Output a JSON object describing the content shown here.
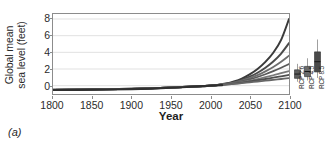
{
  "panel": {
    "letter": "(a)"
  },
  "chart_data": {
    "type": "line",
    "title": "",
    "xlabel": "Year",
    "ylabel": "Global mean sea level (feet)",
    "ylabel_line1": "Global mean",
    "ylabel_line2": "sea level (feet)",
    "xlim": [
      1800,
      2100
    ],
    "ylim": [
      -1.0,
      8.6
    ],
    "xticks": [
      1800,
      1850,
      1900,
      1950,
      2000,
      2050,
      2100
    ],
    "xticklabels": [
      "1800",
      "1850",
      "1900",
      "1950",
      "2000",
      "2050",
      "2100"
    ],
    "yticks": [
      0,
      2,
      4,
      6,
      8
    ],
    "yticklabels": [
      "0",
      "2",
      "4",
      "6",
      "8"
    ],
    "grid": true,
    "grid_axis": "y",
    "legend": "none",
    "colors": {
      "axis": "#8c8c8c",
      "grid": "#d9d9d9",
      "text": "#2b2b2b",
      "background": "#ffffff"
    },
    "series": [
      {
        "name": "Extreme",
        "color": "#3a3a3a",
        "width": 2.0,
        "x": [
          1800,
          1850,
          1900,
          1950,
          1980,
          2000,
          2010,
          2020,
          2030,
          2040,
          2050,
          2060,
          2070,
          2080,
          2090,
          2100
        ],
        "values": [
          -0.5,
          -0.45,
          -0.38,
          -0.22,
          -0.1,
          0.0,
          0.1,
          0.25,
          0.5,
          0.85,
          1.35,
          2.0,
          2.85,
          3.95,
          5.5,
          8.0
        ]
      },
      {
        "name": "High",
        "color": "#4a4a4a",
        "width": 2.0,
        "x": [
          1800,
          1850,
          1900,
          1950,
          1980,
          2000,
          2010,
          2020,
          2030,
          2040,
          2050,
          2060,
          2070,
          2080,
          2090,
          2100
        ],
        "values": [
          -0.5,
          -0.45,
          -0.38,
          -0.22,
          -0.1,
          0.0,
          0.09,
          0.22,
          0.42,
          0.7,
          1.08,
          1.55,
          2.15,
          2.9,
          3.85,
          5.1
        ]
      },
      {
        "name": "Intermediate-High",
        "color": "#6e6e6e",
        "width": 1.8,
        "x": [
          1800,
          1850,
          1900,
          1950,
          1980,
          2000,
          2010,
          2020,
          2030,
          2040,
          2050,
          2060,
          2070,
          2080,
          2090,
          2100
        ],
        "values": [
          -0.5,
          -0.45,
          -0.38,
          -0.22,
          -0.1,
          0.0,
          0.08,
          0.2,
          0.37,
          0.6,
          0.9,
          1.27,
          1.72,
          2.25,
          2.88,
          3.6
        ]
      },
      {
        "name": "Intermediate",
        "color": "#5a5a5a",
        "width": 1.8,
        "x": [
          1800,
          1850,
          1900,
          1950,
          1980,
          2000,
          2010,
          2020,
          2030,
          2040,
          2050,
          2060,
          2070,
          2080,
          2090,
          2100
        ],
        "values": [
          -0.5,
          -0.45,
          -0.38,
          -0.22,
          -0.1,
          0.0,
          0.08,
          0.18,
          0.33,
          0.52,
          0.76,
          1.04,
          1.37,
          1.74,
          2.15,
          2.6
        ]
      },
      {
        "name": "Intermediate-Low",
        "color": "#7a7a7a",
        "width": 1.8,
        "x": [
          1800,
          1850,
          1900,
          1950,
          1980,
          2000,
          2010,
          2020,
          2030,
          2040,
          2050,
          2060,
          2070,
          2080,
          2090,
          2100
        ],
        "values": [
          -0.5,
          -0.45,
          -0.38,
          -0.22,
          -0.1,
          0.0,
          0.07,
          0.16,
          0.28,
          0.43,
          0.6,
          0.8,
          1.02,
          1.25,
          1.5,
          1.75
        ]
      },
      {
        "name": "Low",
        "color": "#4f4f4f",
        "width": 1.8,
        "x": [
          1800,
          1850,
          1900,
          1950,
          1980,
          2000,
          2010,
          2020,
          2030,
          2040,
          2050,
          2060,
          2070,
          2080,
          2090,
          2100
        ],
        "values": [
          -0.5,
          -0.45,
          -0.38,
          -0.22,
          -0.1,
          0.0,
          0.07,
          0.15,
          0.25,
          0.37,
          0.5,
          0.65,
          0.8,
          0.96,
          1.12,
          1.3
        ]
      },
      {
        "name": "Lowest",
        "color": "#666666",
        "width": 1.8,
        "x": [
          1800,
          1850,
          1900,
          1950,
          1980,
          2000,
          2010,
          2020,
          2030,
          2040,
          2050,
          2060,
          2070,
          2080,
          2090,
          2100
        ],
        "values": [
          -0.5,
          -0.45,
          -0.38,
          -0.22,
          -0.1,
          0.0,
          0.06,
          0.13,
          0.21,
          0.3,
          0.4,
          0.5,
          0.6,
          0.7,
          0.8,
          0.9
        ]
      },
      {
        "name": "Historical",
        "color": "#2f2f2f",
        "width": 2.2,
        "x": [
          1800,
          1850,
          1900,
          1930,
          1950,
          1970,
          1990,
          2000,
          2015
        ],
        "values": [
          -0.52,
          -0.48,
          -0.42,
          -0.33,
          -0.25,
          -0.16,
          -0.06,
          0.0,
          0.07
        ]
      }
    ],
    "boxplots": {
      "axis_note": "Projected global mean sea level rise by 2100 by RCP scenario (feet)",
      "items": [
        {
          "label": "RCP 2.6",
          "color": "#5d5d5d",
          "whisker_low": 0.55,
          "q1": 0.95,
          "median": 1.45,
          "q3": 1.95,
          "whisker_high": 2.65
        },
        {
          "label": "RCP 4.5",
          "color": "#6a6a6a",
          "whisker_low": 0.7,
          "q1": 1.15,
          "median": 1.75,
          "q3": 2.35,
          "whisker_high": 3.3
        },
        {
          "label": "RCP 8.5",
          "color": "#4a4a4a",
          "whisker_low": 1.0,
          "q1": 1.7,
          "median": 2.9,
          "q3": 4.05,
          "whisker_high": 5.5
        }
      ]
    }
  }
}
